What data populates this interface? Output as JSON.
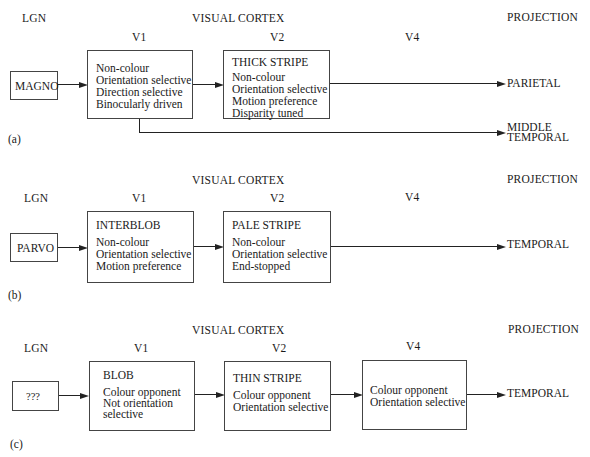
{
  "panels": [
    {
      "id": "a",
      "label": "(a)",
      "headers": {
        "lgn": "LGN",
        "visual_cortex": "VISUAL CORTEX",
        "projection": "PROJECTION",
        "v1": "V1",
        "v2": "V2",
        "v4": "V4"
      },
      "lgn_box": "MAGNO",
      "v1_box": {
        "title": "",
        "lines": [
          "Non-colour",
          "Orientation selective",
          "Direction selective",
          "Binocularly driven"
        ]
      },
      "v2_box": {
        "title": "THICK STRIPE",
        "lines": [
          "Non-colour",
          "Orientation selective",
          "Motion preference",
          "Disparity tuned"
        ]
      },
      "projections": [
        "PARIETAL",
        "MIDDLE",
        "TEMPORAL"
      ]
    },
    {
      "id": "b",
      "label": "(b)",
      "headers": {
        "lgn": "LGN",
        "visual_cortex": "VISUAL CORTEX",
        "projection": "PROJECTION",
        "v1": "V1",
        "v2": "V2",
        "v4": "V4"
      },
      "lgn_box": "PARVO",
      "v1_box": {
        "title": "INTERBLOB",
        "lines": [
          "Non-colour",
          "Orientation selective",
          "Motion preference"
        ]
      },
      "v2_box": {
        "title": "PALE STRIPE",
        "lines": [
          "Non-colour",
          "Orientation selective",
          "End-stopped"
        ]
      },
      "projections": [
        "TEMPORAL"
      ]
    },
    {
      "id": "c",
      "label": "(c)",
      "headers": {
        "lgn": "LGN",
        "visual_cortex": "VISUAL CORTEX",
        "projection": "PROJECTION",
        "v1": "V1",
        "v2": "V2",
        "v4": "V4"
      },
      "lgn_box": "???",
      "v1_box": {
        "title": "BLOB",
        "lines": [
          "Colour opponent",
          "Not orientation",
          "selective"
        ]
      },
      "v2_box": {
        "title": "THIN STRIPE",
        "lines": [
          "Colour opponent",
          "Orientation selective"
        ]
      },
      "v4_box": {
        "title": "",
        "lines": [
          "Colour opponent",
          "Orientation selective"
        ]
      },
      "projections": [
        "TEMPORAL"
      ]
    }
  ]
}
